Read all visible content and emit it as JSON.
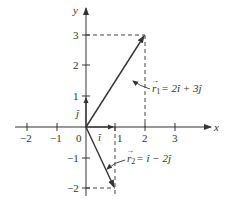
{
  "figure": {
    "type": "vector-diagram",
    "axes": {
      "x_label": "x",
      "y_label": "y",
      "x_ticks": [
        "−2",
        "−1",
        "0",
        "1",
        "2",
        "3"
      ],
      "y_ticks": [
        "3",
        "2",
        "1",
        "−1",
        "−2"
      ],
      "origin_label": "0"
    },
    "unit_vectors": {
      "i_label": "î",
      "j_label": "ĵ"
    },
    "vectors": [
      {
        "name": "r1",
        "label": "r⃗₁ = 2î + 3ĵ",
        "label_parts": {
          "lhs": "r",
          "sub": "1",
          "rhs": "= 2î + 3ĵ"
        },
        "x": 2,
        "y": 3
      },
      {
        "name": "r2",
        "label": "r⃗₂ = î − 2ĵ",
        "label_parts": {
          "lhs": "r",
          "sub": "2",
          "rhs": "= î − 2ĵ"
        },
        "x": 1,
        "y": -2
      }
    ],
    "colors": {
      "line": "#333333",
      "dash": "#444444"
    }
  }
}
